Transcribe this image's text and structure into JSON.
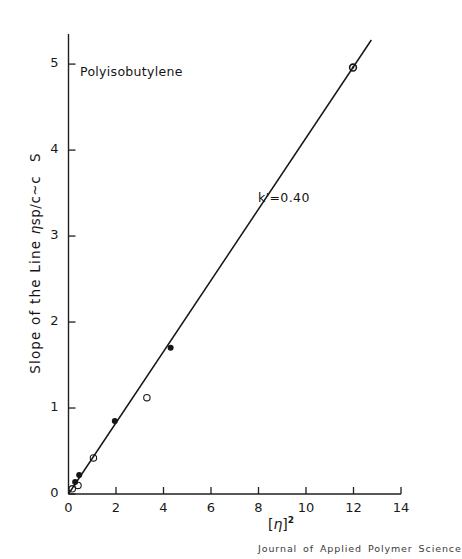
{
  "figure": {
    "background_color": "#ffffff",
    "ink_color": "#1a1a1a"
  },
  "annotations": {
    "sample_label": "Polyisobutylene",
    "slope_constant": "k'=0.40",
    "journal_credit": "Journal of Applied Polymer Science"
  },
  "axis_titles": {
    "y_prefix": "Slope of the Line",
    "y_eta": "η",
    "y_expr": "sp/c~c",
    "y_symbol": "S",
    "x_bracket_open": "[",
    "x_eta": "η",
    "x_bracket_close": "]",
    "x_exponent": "2"
  },
  "chart_data": {
    "type": "scatter",
    "title": "",
    "subtitle": "",
    "xlabel": "[η]²",
    "ylabel": "Slope of the Line ηsp/c~c   S",
    "xlim": [
      0,
      14
    ],
    "ylim": [
      0,
      5.35
    ],
    "xticks": [
      0,
      2,
      4,
      6,
      8,
      10,
      12,
      14
    ],
    "xtick_labels": [
      "0",
      "2",
      "4",
      "6",
      "8",
      "10",
      "12",
      "14"
    ],
    "yticks": [
      0,
      1,
      2,
      3,
      4,
      5
    ],
    "ytick_labels": [
      "0",
      "1",
      "2",
      "3",
      "4",
      "5"
    ],
    "grid": false,
    "legend": "none",
    "annotations": [
      {
        "text": "Polyisobutylene",
        "x": 0.55,
        "y": 4.65
      },
      {
        "text": "k'=0.40",
        "x": 5.95,
        "y": 3.3
      }
    ],
    "series": [
      {
        "name": "open circles",
        "marker": "open-circle",
        "points": [
          {
            "x": 0.16,
            "y": 0.06
          },
          {
            "x": 0.4,
            "y": 0.1
          },
          {
            "x": 1.05,
            "y": 0.42
          },
          {
            "x": 3.3,
            "y": 1.12
          }
        ]
      },
      {
        "name": "filled circles",
        "marker": "filled-circle",
        "points": [
          {
            "x": 0.28,
            "y": 0.14
          },
          {
            "x": 0.45,
            "y": 0.22
          },
          {
            "x": 1.95,
            "y": 0.85
          },
          {
            "x": 4.3,
            "y": 1.7
          }
        ]
      },
      {
        "name": "dotted circle",
        "marker": "circle-with-dot",
        "points": [
          {
            "x": 11.98,
            "y": 4.96
          }
        ]
      }
    ],
    "fit_line": {
      "name": "k'=0.40 fit",
      "slope": 0.4,
      "intercept": 0.0,
      "x_start": 0.0,
      "y_start": 0.0,
      "x_end": 12.75,
      "y_end": 5.28
    }
  }
}
